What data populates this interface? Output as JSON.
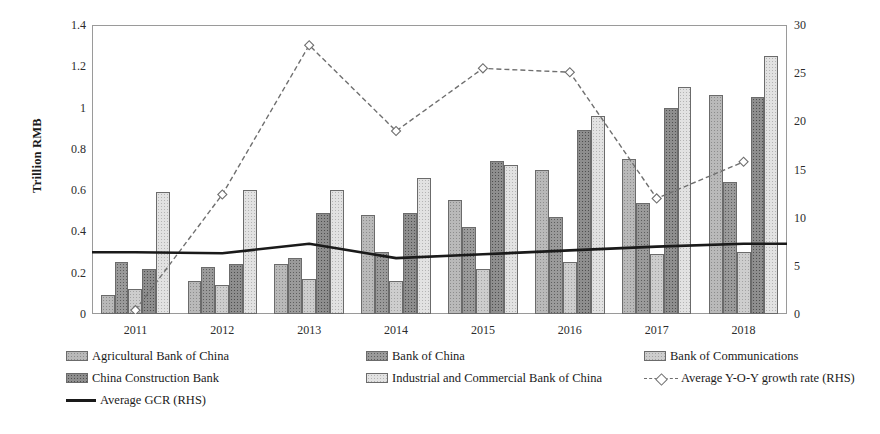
{
  "chart_data": {
    "type": "bar",
    "title": "",
    "xlabel": "",
    "ylabel": "Trillion RMB",
    "y2label": "Percentage",
    "categories": [
      "2011",
      "2012",
      "2013",
      "2014",
      "2015",
      "2016",
      "2017",
      "2018"
    ],
    "ylim": [
      0,
      1.4
    ],
    "y2lim": [
      0,
      30
    ],
    "yticks": [
      "0",
      "0.2",
      "0.4",
      "0.6",
      "0.8",
      "1",
      "1.2",
      "1.4"
    ],
    "ytick_values": [
      0,
      0.2,
      0.4,
      0.6,
      0.8,
      1.0,
      1.2,
      1.4
    ],
    "y2ticks": [
      "0",
      "5",
      "10",
      "15",
      "20",
      "25",
      "30"
    ],
    "y2tick_values": [
      0,
      5,
      10,
      15,
      20,
      25,
      30
    ],
    "grid": false,
    "legend_position": "bottom",
    "series": [
      {
        "name": "Agricultural Bank of China",
        "kind": "bar",
        "axis": "left",
        "values": [
          0.09,
          0.16,
          0.24,
          0.48,
          0.55,
          0.7,
          0.75,
          1.06
        ]
      },
      {
        "name": "Bank of China",
        "kind": "bar",
        "axis": "left",
        "values": [
          0.25,
          0.23,
          0.27,
          0.3,
          0.42,
          0.47,
          0.54,
          0.64
        ]
      },
      {
        "name": "Bank of Communications",
        "kind": "bar",
        "axis": "left",
        "values": [
          0.12,
          0.14,
          0.17,
          0.16,
          0.22,
          0.25,
          0.29,
          0.3
        ]
      },
      {
        "name": "China Construction Bank",
        "kind": "bar",
        "axis": "left",
        "values": [
          0.22,
          0.24,
          0.49,
          0.49,
          0.74,
          0.89,
          1.0,
          1.05
        ]
      },
      {
        "name": "Industrial and Commercial Bank of China",
        "kind": "bar",
        "axis": "left",
        "values": [
          0.59,
          0.6,
          0.6,
          0.66,
          0.72,
          0.96,
          1.1,
          1.25
        ]
      },
      {
        "name": "Average Y-O-Y growth rate (RHS)",
        "kind": "line-dashed",
        "axis": "right",
        "values": [
          0.4,
          12.4,
          27.9,
          19.0,
          25.5,
          25.1,
          12.0,
          15.8
        ]
      },
      {
        "name": "Average GCR (RHS)",
        "kind": "line-solid",
        "axis": "right",
        "values": [
          6.4,
          6.3,
          7.3,
          5.8,
          6.2,
          6.6,
          7.0,
          7.3
        ]
      }
    ]
  },
  "legend": {
    "rows": [
      [
        {
          "label": "Agricultural Bank of China",
          "marker": "swatch",
          "swatch": 0
        },
        {
          "label": "Bank of China",
          "marker": "swatch",
          "swatch": 1
        },
        {
          "label": "Bank of Communications",
          "marker": "swatch",
          "swatch": 2
        }
      ],
      [
        {
          "label": "China Construction Bank",
          "marker": "swatch",
          "swatch": 3
        },
        {
          "label": "Industrial and Commercial Bank of China",
          "marker": "swatch",
          "swatch": 4
        },
        {
          "label": "Average Y-O-Y growth rate (RHS)",
          "marker": "dashed-line"
        }
      ],
      [
        {
          "label": "Average GCR (RHS)",
          "marker": "solid-line"
        }
      ]
    ]
  },
  "colors": {
    "frame": "#9a9a9a",
    "solid_line": "#1a1a1a",
    "dashed_line": "#6f6f6f",
    "text": "#1a1a1a",
    "bar_fills": [
      "#b9b9b9",
      "#9a9a9a",
      "#cdcdcd",
      "#8e8e8e",
      "#e2e2e2"
    ],
    "bar_border": "#6b6b6b"
  }
}
